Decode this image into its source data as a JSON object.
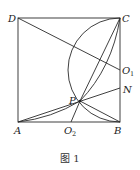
{
  "figure": {
    "caption": "图 1",
    "points": {
      "A": {
        "label": "A",
        "x": 18,
        "y": 122
      },
      "B": {
        "label": "B",
        "x": 120,
        "y": 122
      },
      "C": {
        "label": "C",
        "x": 120,
        "y": 18
      },
      "D": {
        "label": "D",
        "x": 18,
        "y": 18
      },
      "P": {
        "label": "P",
        "x": 80,
        "y": 101
      },
      "N": {
        "label": "N",
        "x": 120,
        "y": 88
      },
      "O1": {
        "label": "O",
        "sub": "1",
        "x": 120,
        "y": 70
      },
      "O2": {
        "label": "O",
        "sub": "2",
        "x": 71,
        "y": 122
      }
    },
    "segments": [
      "AB",
      "BC",
      "CD",
      "DA",
      "DO1",
      "AN",
      "PC",
      "PB",
      "O2C"
    ],
    "arcs": [
      "C-B (center O1)",
      "A-P",
      "P-C"
    ]
  }
}
